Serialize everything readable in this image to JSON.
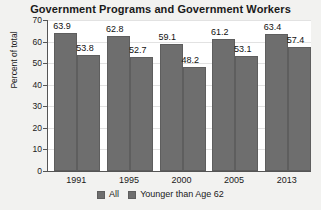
{
  "chart_data": {
    "type": "bar",
    "title": "Government Programs and Government Workers",
    "xlabel": "",
    "ylabel": "Percent of total",
    "categories": [
      "1991",
      "1995",
      "2000",
      "2005",
      "2013"
    ],
    "series": [
      {
        "name": "All",
        "values": [
          63.9,
          62.8,
          59.1,
          61.2,
          63.4
        ]
      },
      {
        "name": "Younger than Age 62",
        "values": [
          53.8,
          52.7,
          48.2,
          53.1,
          57.4
        ]
      }
    ],
    "ylim": [
      0,
      70
    ],
    "yticks": [
      0,
      10,
      20,
      30,
      40,
      50,
      60,
      70
    ],
    "grid": true,
    "legend_position": "bottom",
    "bar_color": "#6e6e6e",
    "plot_background": "#ffffff",
    "figure_background": "#f2f2f0"
  }
}
